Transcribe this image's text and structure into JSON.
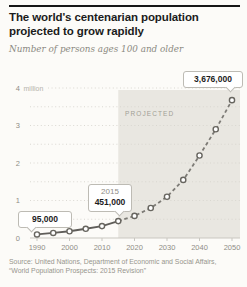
{
  "header": {
    "title": "The world's centenarian population projected to grow rapidly",
    "subtitle": "Number of persons ages 100 and older"
  },
  "callouts": {
    "start": {
      "value": "95,000"
    },
    "mid": {
      "year": "2015",
      "value": "451,000"
    },
    "end": {
      "value": "3,676,000"
    }
  },
  "footer": {
    "source_line1": "Source: United Nations, Department of Economic and Social Affairs,",
    "source_line2": "“World Population Prospects: 2015 Revision”"
  },
  "chart_data": {
    "type": "line",
    "title": "The world's centenarian population projected to grow rapidly",
    "ylabel": "Number of persons ages 100 and older (millions)",
    "xlabel": "Year",
    "x": [
      1990,
      1995,
      2000,
      2005,
      2010,
      2015,
      2020,
      2025,
      2030,
      2035,
      2040,
      2045,
      2050
    ],
    "series": [
      {
        "name": "World centenarian population (thousands)",
        "values_thousands": [
          95,
          135,
          180,
          245,
          317,
          451,
          589,
          800,
          1100,
          1550,
          2200,
          2900,
          3676
        ]
      }
    ],
    "known_labeled_values": {
      "1990": 95000,
      "2015": 451000,
      "2050": 3676000
    },
    "projection_start_year": 2015,
    "projected_region_label": "PROJECTED",
    "projected_line_style": "dashed",
    "marker": "open-circle",
    "x_ticks": [
      1990,
      2000,
      2010,
      2020,
      2030,
      2040,
      2050
    ],
    "y_ticks_millions": [
      0,
      1,
      2,
      3,
      4
    ],
    "y_unit_label": "million",
    "ylim_millions": [
      0,
      4
    ],
    "gridline_step_millions": 0.5,
    "grid": true,
    "legend": false,
    "line_color": "#5f5d59",
    "projected_line_color": "#7d7b76",
    "shaded_region_color": "#e9e7e1",
    "gridline_color": "#d7d5ce",
    "axis_color": "#c9c7c0"
  }
}
